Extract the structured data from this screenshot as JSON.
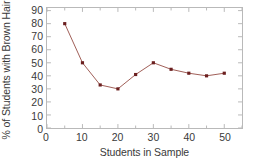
{
  "chart_data": {
    "type": "line",
    "title": "",
    "xlabel": "Students in Sample",
    "ylabel": "% of Students with Brown Hair",
    "x": [
      5,
      10,
      15,
      20,
      25,
      30,
      35,
      40,
      45,
      50
    ],
    "values": [
      80,
      50,
      33,
      30,
      41,
      50,
      45,
      42,
      40,
      42
    ],
    "series": [
      {
        "name": "% of Students with Brown Hair",
        "x": [
          5,
          10,
          15,
          20,
          25,
          30,
          35,
          40,
          45,
          50
        ],
        "values": [
          80,
          50,
          33,
          30,
          41,
          50,
          45,
          42,
          40,
          42
        ]
      }
    ],
    "xlim": [
      0,
      55
    ],
    "ylim": [
      0,
      92
    ],
    "xticks": [
      0,
      10,
      20,
      30,
      40,
      50
    ],
    "xticklabels": [
      "0",
      "10",
      "20",
      "30",
      "40",
      "50"
    ],
    "xminorticks": [
      5,
      15,
      25,
      35,
      45,
      55
    ],
    "yticks": [
      0,
      10,
      20,
      30,
      40,
      50,
      60,
      70,
      80,
      90
    ],
    "yticklabels": [
      "0",
      "10",
      "20",
      "30",
      "40",
      "50",
      "60",
      "70",
      "80",
      "90"
    ],
    "grid": false,
    "legend": null,
    "annotations": [],
    "colors": {
      "line": "#9e5c55",
      "marker": "#6b1f1f",
      "frame": "#b9b9b9",
      "text": "#3a3a3a",
      "background": "#ffffff"
    },
    "marker": "square",
    "marker_size": 3.2,
    "line_width": 1
  }
}
